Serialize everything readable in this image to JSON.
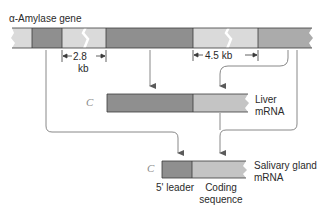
{
  "title": "α-Amylase gene",
  "gene": {
    "intron1_length": "2.8",
    "intron1_unit": "kb",
    "intron2_length": "4.5 kb"
  },
  "liver_mrna": {
    "cap": "C",
    "label_line1": "Liver",
    "label_line2": "mRNA"
  },
  "salivary_mrna": {
    "cap": "C",
    "label_line1": "Salivary gland",
    "label_line2": "mRNA",
    "leader_label": "5' leader",
    "coding_label_line1": "Coding",
    "coding_label_line2": "sequence"
  },
  "colors": {
    "exon_dark": "#8f8f8f",
    "exon_medium": "#a9a9a9",
    "intron_light": "#dadada",
    "coding_light": "#c4c4c4",
    "outline": "#3a3a3a",
    "arrow": "#6a6a6a"
  }
}
